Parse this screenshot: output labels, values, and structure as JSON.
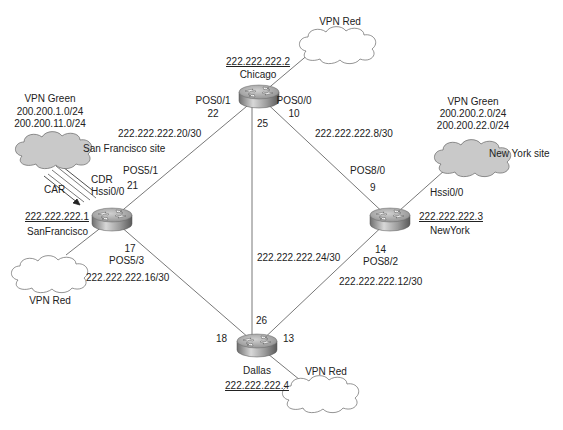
{
  "diagram": {
    "type": "network-topology",
    "routers": [
      {
        "id": "chicago",
        "name": "Chicago",
        "loopback": "222.222.222.2"
      },
      {
        "id": "sanfrancisco",
        "name": "SanFrancisco",
        "loopback": "222.222.222.1"
      },
      {
        "id": "newyork",
        "name": "NewYork",
        "loopback": "222.222.222.3"
      },
      {
        "id": "dallas",
        "name": "Dallas",
        "loopback": "222.222.222.4"
      }
    ],
    "links": [
      {
        "from": "sanfrancisco",
        "to": "chicago",
        "subnet": "222.222.222.20/30",
        "from_if": "POS5/1",
        "from_host": "21",
        "to_if": "POS0/1",
        "to_host": "22"
      },
      {
        "from": "chicago",
        "to": "newyork",
        "subnet": "222.222.222.8/30",
        "from_if": "POS0/0",
        "from_host": "10",
        "to_if": "POS8/0",
        "to_host": "9"
      },
      {
        "from": "chicago",
        "to": "dallas",
        "subnet": "222.222.222.24/30",
        "from_host": "25",
        "to_host": "26"
      },
      {
        "from": "sanfrancisco",
        "to": "dallas",
        "subnet": "222.222.222.16/30",
        "from_if": "POS5/3",
        "from_host": "17",
        "to_host": "18"
      },
      {
        "from": "newyork",
        "to": "dallas",
        "subnet": "222.222.222.12/30",
        "from_if": "POS8/2",
        "from_host": "14",
        "to_host": "13"
      }
    ],
    "clouds": {
      "sf_green": {
        "vpn": "VPN Green",
        "prefix1": "200.200.1.0/24",
        "prefix2": "200.200.11.0/24",
        "site": "San Francisco site",
        "interface": "Hssi0/0",
        "car": "CAR",
        "cdr": "CDR"
      },
      "ny_green": {
        "vpn": "VPN Green",
        "prefix1": "200.200.2.0/24",
        "prefix2": "200.200.22.0/24",
        "site": "New York site",
        "interface": "Hssi0/0"
      },
      "chicago_red": {
        "vpn": "VPN Red"
      },
      "sf_red": {
        "vpn": "VPN Red"
      },
      "dallas_red": {
        "vpn": "VPN Red"
      }
    },
    "colors": {
      "background": "#ffffff",
      "line": "#555555",
      "green_cloud_fill": "#c9c9c9",
      "red_cloud_fill": "#ffffff",
      "router_top": "#b8b8b8",
      "router_side": "#8a8a8a"
    }
  }
}
